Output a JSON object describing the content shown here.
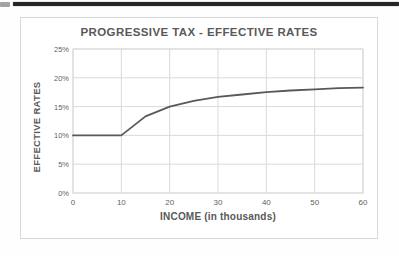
{
  "fragments": {
    "top_left_block_color": "#a3a3a3",
    "top_bar_color": "#262626"
  },
  "colors": {
    "chart_border": "#d8d8d6",
    "gridline": "#dadada",
    "text": "#595959",
    "line": "#595959",
    "background": "#ffffff"
  },
  "chart_data": {
    "type": "line",
    "title": "PROGRESSIVE TAX - EFFECTIVE RATES",
    "xlabel": "INCOME (in thousands)",
    "ylabel": "EFFECTIVE RATES",
    "x": [
      0,
      5,
      10,
      15,
      20,
      25,
      30,
      35,
      40,
      45,
      50,
      55,
      60
    ],
    "y_percent": [
      10,
      10,
      10,
      13.3,
      15,
      16,
      16.7,
      17.1,
      17.5,
      17.8,
      18,
      18.2,
      18.3
    ],
    "xlim": [
      0,
      60
    ],
    "ylim_percent": [
      0,
      25
    ],
    "x_ticks": [
      {
        "v": 0,
        "label": "0"
      },
      {
        "v": 10,
        "label": "10"
      },
      {
        "v": 20,
        "label": "20"
      },
      {
        "v": 30,
        "label": "30"
      },
      {
        "v": 40,
        "label": "40"
      },
      {
        "v": 50,
        "label": "50"
      },
      {
        "v": 60,
        "label": "60"
      }
    ],
    "y_ticks": [
      {
        "v": 0,
        "label": "0%"
      },
      {
        "v": 5,
        "label": "5%"
      },
      {
        "v": 10,
        "label": "10%"
      },
      {
        "v": 15,
        "label": "15%"
      },
      {
        "v": 20,
        "label": "20%"
      },
      {
        "v": 25,
        "label": "25%"
      }
    ],
    "grid": true,
    "legend": "none",
    "line_color": "#595959"
  }
}
